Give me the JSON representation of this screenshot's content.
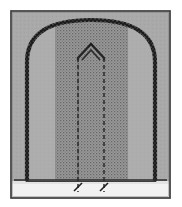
{
  "figure": {
    "kind": "architectural-elevation-drawing",
    "title": "Arched elevation with stippled infill and central pointed gable",
    "caption": "",
    "background_color": "#ffffff",
    "frame": {
      "name": "drawing-border",
      "x": 11,
      "y": 11,
      "width": 159,
      "height": 187,
      "stroke_color": "#3a3a3a",
      "stroke_width": 1.6,
      "fill_color": "#b9b9b9"
    },
    "ground_panel": {
      "name": "ground-strip",
      "x": 12,
      "y": 181,
      "width": 157,
      "height": 16,
      "fill_color": "#f2f2f2",
      "label": ""
    },
    "baseline": {
      "name": "springing-baseline",
      "x1": 14,
      "x2": 167,
      "y": 180,
      "stroke_color": "#2b2b2b",
      "stroke_width": 1.5
    },
    "outer_arch": {
      "name": "outer-arch-profile",
      "left_x": 27,
      "right_x": 155,
      "base_y": 180,
      "spring_y": 60,
      "apex_y": 20,
      "stroke_color": "#1f1f1f",
      "stroke_width": 2.6,
      "texture": "beaded-scalloped",
      "bead_count": 150,
      "bead_radius": 1.5
    },
    "stipple_panel": {
      "name": "stippled-infill",
      "left_x": 55,
      "right_x": 128,
      "top_y": 26,
      "bottom_y": 180,
      "fill_color": "#9a9a9a",
      "dot_color": "#5e5e5e",
      "pattern": "fine-stipple-dots",
      "dot_spacing": 3
    },
    "wall_fill": {
      "name": "arch-field-fill",
      "fill_color": "#a8a8a8"
    },
    "center_gable": {
      "name": "central-pointed-gable",
      "apex_x": 91,
      "apex_y": 44,
      "left_x": 78,
      "right_x": 104,
      "spring_y": 58,
      "stroke_color": "#262626",
      "stroke_width": 2.2,
      "inner_apex_y": 50
    },
    "dashed_lines": [
      {
        "name": "construction-line-left",
        "x": 78,
        "y_top": 58,
        "y_bottom": 192,
        "dash": "4 3",
        "stroke_color": "#2a2a2a",
        "stroke_width": 1.4
      },
      {
        "name": "construction-line-right",
        "x": 104,
        "y_top": 58,
        "y_bottom": 192,
        "dash": "4 3",
        "stroke_color": "#2a2a2a",
        "stroke_width": 1.4
      }
    ],
    "tick_marks": [
      {
        "name": "dimension-tick-left",
        "x": 78,
        "y": 186,
        "angle_deg": 28,
        "length": 9,
        "stroke_color": "#1e1e1e"
      },
      {
        "name": "dimension-tick-right",
        "x": 104,
        "y": 186,
        "angle_deg": 28,
        "length": 9,
        "stroke_color": "#1e1e1e"
      }
    ],
    "annotations": [],
    "palette": {
      "paper": "#ffffff",
      "field_gray": "#a8a8a8",
      "panel_gray": "#9a9a9a",
      "ink": "#1f1f1f",
      "ground": "#f2f2f2"
    }
  }
}
